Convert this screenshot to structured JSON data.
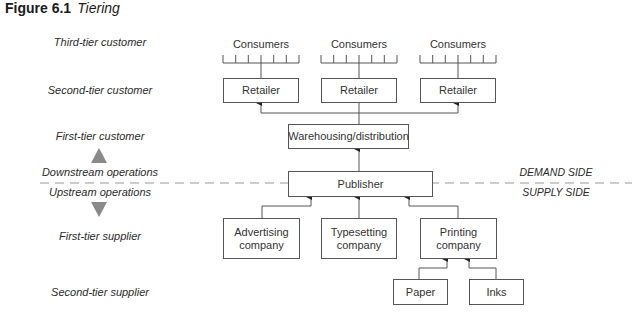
{
  "figure": {
    "number": "Figure 6.1",
    "title": "Tiering"
  },
  "tier_labels": {
    "third_tier_customer": "Third-tier customer",
    "second_tier_customer": "Second-tier customer",
    "first_tier_customer": "First-tier customer",
    "downstream": "Downstream operations",
    "upstream": "Upstream operations",
    "first_tier_supplier": "First-tier supplier",
    "second_tier_supplier": "Second-tier supplier"
  },
  "sides": {
    "demand": "DEMAND SIDE",
    "supply": "SUPPLY SIDE"
  },
  "nodes": {
    "consumers": [
      "Consumers",
      "Consumers",
      "Consumers"
    ],
    "retailers": [
      "Retailer",
      "Retailer",
      "Retailer"
    ],
    "warehousing": "Warehousing/distribution",
    "publisher": "Publisher",
    "advertising": "Advertising company",
    "typesetting": "Typesetting company",
    "printing": "Printing company",
    "paper": "Paper",
    "inks": "Inks"
  },
  "colors": {
    "line": "#555555",
    "arrow_triangle": "#8a8a8a",
    "dash": "#9a9a9a"
  }
}
